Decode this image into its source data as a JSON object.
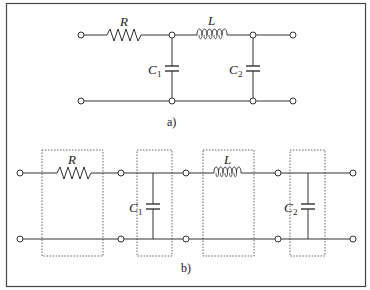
{
  "figure": {
    "frame_color": "#444444",
    "wire_color": "#333333",
    "box_color": "#555555"
  },
  "circuit_a": {
    "caption": "a)",
    "components": {
      "resistor": {
        "label": "R"
      },
      "inductor": {
        "label": "L"
      },
      "capacitor1": {
        "label": "C",
        "subscript": "1"
      },
      "capacitor2": {
        "label": "C",
        "subscript": "2"
      }
    }
  },
  "circuit_b": {
    "caption": "b)",
    "blocks": [
      {
        "type": "series",
        "component": "resistor",
        "label": "R"
      },
      {
        "type": "shunt",
        "component": "capacitor",
        "label": "C",
        "subscript": "1"
      },
      {
        "type": "series",
        "component": "inductor",
        "label": "L"
      },
      {
        "type": "shunt",
        "component": "capacitor",
        "label": "C",
        "subscript": "2"
      }
    ]
  }
}
